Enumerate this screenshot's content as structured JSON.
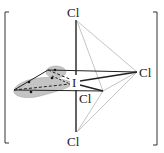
{
  "diagram": {
    "type": "molecular-geometry",
    "central_atom": {
      "label": "I",
      "x": 75,
      "y": 83
    },
    "ligands": [
      {
        "id": "cl-top",
        "label": "Cl",
        "x": 75,
        "y": 15
      },
      {
        "id": "cl-right",
        "label": "Cl",
        "x": 148,
        "y": 76
      },
      {
        "id": "cl-front",
        "label": "Cl",
        "x": 86,
        "y": 102
      },
      {
        "id": "cl-bottom",
        "label": "Cl",
        "x": 75,
        "y": 147
      }
    ],
    "lone_pair_label": "lone pair",
    "brackets": {
      "left": "[",
      "right": "]"
    },
    "colors": {
      "bond": "#222222",
      "light_edge": "#aaaaaa",
      "lone_pair_fill": "#bdbdbd",
      "text": "#222222"
    }
  }
}
